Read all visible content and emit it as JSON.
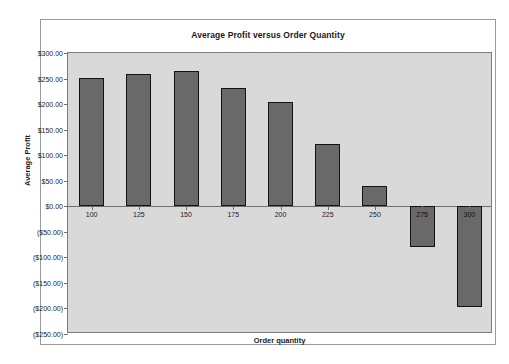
{
  "chart_data": {
    "type": "bar",
    "title": "Average Profit versus Order Quantity",
    "xlabel": "Order quantity",
    "ylabel": "Average Profit",
    "categories": [
      "100",
      "125",
      "150",
      "175",
      "200",
      "225",
      "250",
      "275",
      "300"
    ],
    "values": [
      252,
      258,
      264,
      232,
      205,
      122,
      40,
      -80,
      -197
    ],
    "ylim": [
      -250,
      300
    ],
    "ytick_values": [
      300,
      250,
      200,
      150,
      100,
      50,
      0,
      -50,
      -100,
      -150,
      -200,
      -250
    ],
    "ytick_labels": [
      "$300.00",
      "$250.00",
      "$200.00",
      "$150.00",
      "$100.00",
      "$50.00",
      "$0.00",
      "($50.00)",
      "($100.00)",
      "($150.00)",
      "($200.00)",
      "($250.00)"
    ],
    "grid": false,
    "legend": false,
    "legend_position": "none",
    "bar_color": "#696969",
    "bar_border_color": "#131313",
    "plot_background": "#d9d9d9",
    "frame_background": "#ffffff"
  }
}
